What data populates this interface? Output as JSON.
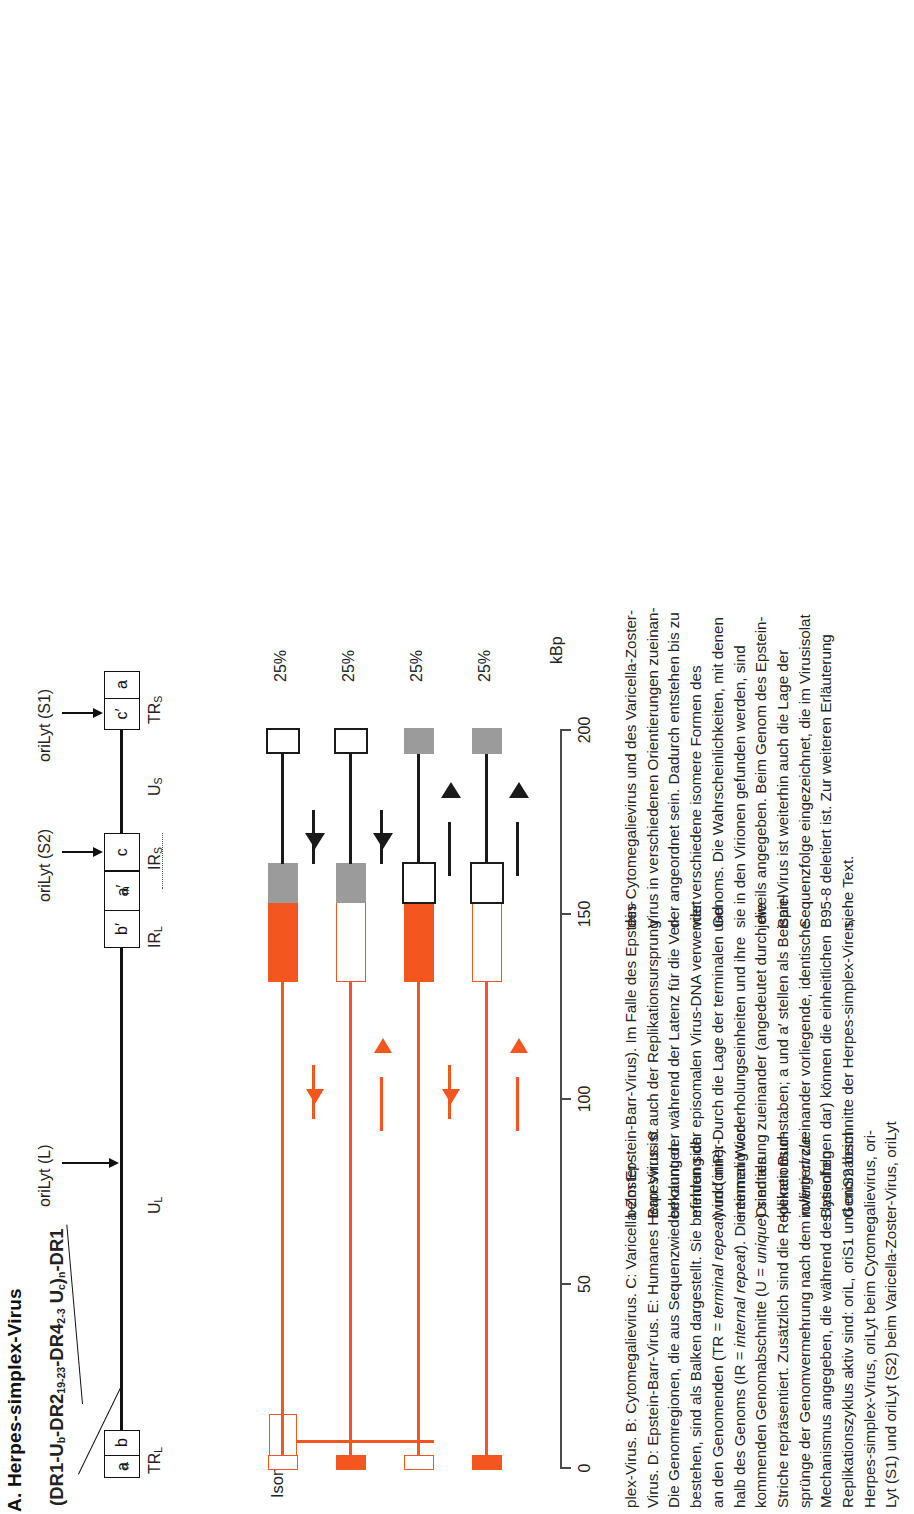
{
  "figure": {
    "title": "A. Herpes-simplex-Virus",
    "a_sequence_formula": "(DR1-U",
    "formula_parts": {
      "p1": "(DR1-U",
      "sub_b": "b",
      "p2": "-DR2",
      "sub_1923": "19-23",
      "p3": "-DR4",
      "sub_23": "2-3",
      "p4": " U",
      "sub_c": "c",
      "p5": ")",
      "sub_n": "n",
      "p6": "-DR1"
    },
    "isomere_label": "Isomere:"
  },
  "genome_map": {
    "boxes": [
      {
        "id": "an",
        "text": "a",
        "sub": "n"
      },
      {
        "id": "b",
        "text": "b",
        "sub": ""
      },
      {
        "id": "bp",
        "text": "b′",
        "sub": ""
      },
      {
        "id": "apm",
        "text": "a′",
        "sub": "m"
      },
      {
        "id": "c",
        "text": "c",
        "sub": ""
      },
      {
        "id": "cp",
        "text": "c′",
        "sub": ""
      },
      {
        "id": "a",
        "text": "a",
        "sub": ""
      }
    ],
    "region_labels": [
      {
        "id": "TRL",
        "text": "TR",
        "sub": "L"
      },
      {
        "id": "UL",
        "text": "U",
        "sub": "L"
      },
      {
        "id": "IRL",
        "text": "IR",
        "sub": "L"
      },
      {
        "id": "IRS",
        "text": "IR",
        "sub": "S"
      },
      {
        "id": "US",
        "text": "U",
        "sub": "S"
      },
      {
        "id": "TRS",
        "text": "TR",
        "sub": "S"
      }
    ],
    "origin_labels": [
      {
        "id": "oriLytL",
        "text": "oriLyt (L)"
      },
      {
        "id": "oriLytS2",
        "text": "oriLyt (S2)"
      },
      {
        "id": "oriLytS1",
        "text": "oriLyt (S1)"
      }
    ]
  },
  "chart_data": {
    "type": "diagram",
    "title": "A. Herpes-simplex-Virus",
    "xlabel": "kBp",
    "xlim": [
      0,
      210
    ],
    "ticks": [
      0,
      50,
      100,
      150,
      200
    ],
    "tick_labels": [
      "0",
      "50",
      "100",
      "150",
      "200"
    ],
    "grid": false,
    "isomers": [
      {
        "name": "P (prototype)",
        "percent": "25%",
        "left_cap": "open-orange",
        "left_segment": "orange-filled",
        "right_segment": "gray",
        "right_cap": "open-black",
        "orange_arrow": "up",
        "black_arrow": "up"
      },
      {
        "name": "IL (inverted L)",
        "percent": "25%",
        "left_cap": "orange-filled",
        "left_segment": "open-orange",
        "right_segment": "gray",
        "right_cap": "open-black",
        "orange_arrow": "down",
        "black_arrow": "up"
      },
      {
        "name": "IS (inverted S)",
        "percent": "25%",
        "left_cap": "open-orange",
        "left_segment": "orange-filled",
        "right_segment": "open-black",
        "right_cap": "gray",
        "orange_arrow": "up",
        "black_arrow": "down"
      },
      {
        "name": "ISL (inverted S+L)",
        "percent": "25%",
        "left_cap": "orange-filled",
        "left_segment": "open-orange",
        "right_segment": "open-black",
        "right_cap": "gray",
        "orange_arrow": "down",
        "black_arrow": "down"
      }
    ]
  },
  "colors": {
    "orange": "#f4561f",
    "gray": "#9b9b9b",
    "black": "#1a1a1a",
    "axis": "#4a4a4a"
  },
  "caption": {
    "columns": [
      [
        "plex-Virus.  B:  Cytomegalievirus.  C:  Varicella-Zoster-",
        "Virus. D: Epstein-Barr-Virus. E: Humanes Herpesvirus 6.",
        "Die Genomregionen, die aus Sequenzwiederholungen",
        "bestehen, sind als Balken dargestellt. Sie befinden sich",
        "an den Genomenden (TR = terminal repeat) und inner-",
        "halb des Genoms (IR = internal repeat). Die einmalig vor-",
        "kommenden Genomabschnitte (U = unique) sind als",
        "Striche repräsentiert. Zusätzlich sind die Replikationsur-",
        "sprünge der Genomvermehrung nach dem rolling circle-",
        "Mechanismus angegeben, die während des lytischen",
        "Replikationszyklus aktiv sind: oriL, oriS1 und oriS2 beim",
        "Herpes-simplex-Virus, oriLyt beim Cytomegalievirus, ori-",
        "Lyt (S1) und oriLyt (S2) beim Varicella-Zoster-Virus, oriLyt"
      ],
      [
        "beim Epstein-Barr-Virus). Im Falle des Epstein-",
        "Barr-Virus ist auch der Replikationsursprung",
        "bekannt, der während der Latenz für die Ver-",
        "mehrung der episomalen Virus-DNA verwendet",
        "wird (oriP). Durch die Lage der terminalen und",
        "internen  Wiederholungseinheiten  und  ihre",
        "Orientierung zueinander (angedeutet durch die",
        "kleinen Buchstaben; a und a′ stellen als Beispiel",
        "invertiert  zueinander  vorliegende,  identische",
        "Basenfolgen  dar)  können  die  einheitlichen",
        "Genomabschnitte  der  Herpes-simplex-Viren,"
      ],
      [
        "des Cytomegalievirus und des Varicella-Zoster-",
        "Virus in verschiedenen Orientierungen zueinan-",
        "der angeordnet sein. Dadurch entstehen bis zu",
        "vier   verschiedene   isomere   Formen   des",
        "Genoms. Die Wahrscheinlichkeiten, mit denen",
        "sie in den Virionen gefunden werden, sind",
        "jeweils angegeben. Beim Genom des Epstein-",
        "Barr-Virus ist weiterhin auch die Lage der",
        "Sequenzfolge eingezeichnet, die im Virusisolat",
        "B95-8 deletiert ist. Zur weiteren Erläuterung",
        "siehe Text."
      ]
    ]
  }
}
